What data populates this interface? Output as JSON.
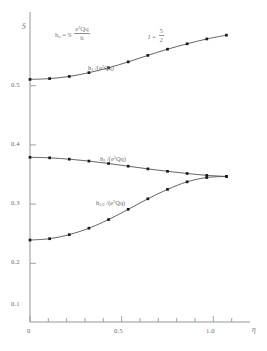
{
  "chart_data": {
    "type": "line",
    "title": "",
    "xlabel": "η",
    "ylabel": "S",
    "xlim": [
      0.0,
      1.12
    ],
    "ylim": [
      0.0,
      0.575
    ],
    "grid": false,
    "legend_position": "inline-curve-labels",
    "x_ticks_major": [
      0,
      0.5,
      1.0
    ],
    "x_tick_labels": [
      "0",
      "0.5",
      "1.0"
    ],
    "x_ticks_minor": [
      0.1,
      0.2,
      0.3,
      0.4,
      0.6,
      0.7,
      0.8,
      0.9,
      1.1
    ],
    "y_ticks_major": [
      0.1,
      0.2,
      0.3,
      0.4,
      0.5
    ],
    "y_tick_labels": [
      "0.1",
      "0.2",
      "0.3",
      "0.4",
      "0.5"
    ],
    "x": [
      0.0,
      0.1,
      0.2,
      0.3,
      0.4,
      0.5,
      0.6,
      0.7,
      0.8,
      0.9,
      1.0
    ],
    "series": [
      {
        "name": "h1_over_e2Qq",
        "label_html": "h<sub>1</sub> /(e<sup>2</sup>Qq)",
        "label_text": "h1 /(e2Qq)",
        "marker": "square",
        "values": [
          0.45,
          0.4515,
          0.4555,
          0.4625,
          0.4715,
          0.4825,
          0.4945,
          0.506,
          0.516,
          0.525,
          0.532
        ]
      },
      {
        "name": "h2_over_e2Qq",
        "label_html": "h<sub>2</sub> /(e<sup>2</sup>Qq)",
        "label_text": "h2 /(e2Qq)",
        "marker": "square",
        "values": [
          0.3055,
          0.3045,
          0.302,
          0.2985,
          0.294,
          0.289,
          0.284,
          0.2795,
          0.2755,
          0.272,
          0.27
        ]
      },
      {
        "name": "h3_over_e2Qq",
        "label_html": "h<sub>3/2</sub> /(e<sup>2</sup>Qq)",
        "label_text": "h3/2 /(e2Qq)",
        "marker": "square",
        "values": [
          0.152,
          0.1545,
          0.162,
          0.174,
          0.19,
          0.209,
          0.2285,
          0.246,
          0.26,
          0.268,
          0.27
        ]
      }
    ],
    "annotations": [
      {
        "name": "definition-formula",
        "text": "h_a = S e2Qq / h",
        "lhs": "h",
        "lhs_sub": "a",
        "equals": "= S",
        "frac_num": "e²Qq",
        "frac_den": "h"
      },
      {
        "name": "spin-value",
        "text": "I = 5/2",
        "symbol": "I",
        "equals": "=",
        "frac_num": "5",
        "frac_den": "2"
      }
    ]
  },
  "colors": {
    "axis": "#8a8a8a",
    "curve": "#4a4a4a",
    "marker": "#1a1a1a",
    "text": "#6e6e6e",
    "background": "#ffffff"
  }
}
